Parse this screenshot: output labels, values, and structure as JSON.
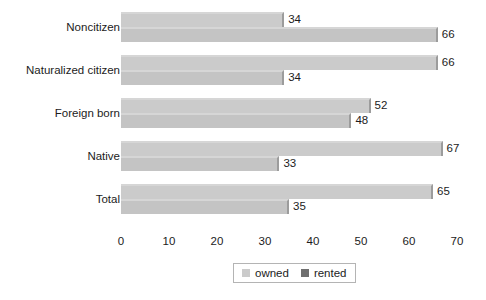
{
  "chart_data": {
    "type": "bar",
    "orientation": "horizontal",
    "title": "",
    "subtitle": "",
    "xlabel": "",
    "ylabel": "",
    "xlim": [
      0,
      70
    ],
    "xticks": [
      0,
      10,
      20,
      30,
      40,
      50,
      60,
      70
    ],
    "xtick_labels": [
      "0",
      "10",
      "20",
      "30",
      "40",
      "50",
      "60",
      "70"
    ],
    "grid": false,
    "legend_position": "bottom",
    "categories": [
      "Noncitizen",
      "Naturalized citizen",
      "Foreign born",
      "Native",
      "Total"
    ],
    "series": [
      {
        "name": "owned",
        "color": "#cbcbcb",
        "values": [
          34,
          66,
          52,
          67,
          65
        ]
      },
      {
        "name": "rented",
        "color": "#c4c4c4",
        "values": [
          66,
          34,
          48,
          33,
          35
        ]
      }
    ],
    "bars": [
      {
        "category": "Noncitizen",
        "top": {
          "series": "owned",
          "value": 34,
          "label": "34"
        },
        "bottom": {
          "series": "rented",
          "value": 66,
          "label": "66"
        }
      },
      {
        "category": "Naturalized citizen",
        "top": {
          "series": "owned",
          "value": 66,
          "label": "66"
        },
        "bottom": {
          "series": "rented",
          "value": 34,
          "label": "34"
        }
      },
      {
        "category": "Foreign born",
        "top": {
          "series": "owned",
          "value": 52,
          "label": "52"
        },
        "bottom": {
          "series": "rented",
          "value": 48,
          "label": "48"
        }
      },
      {
        "category": "Native",
        "top": {
          "series": "owned",
          "value": 67,
          "label": "67"
        },
        "bottom": {
          "series": "rented",
          "value": 33,
          "label": "33"
        }
      },
      {
        "category": "Total",
        "top": {
          "series": "owned",
          "value": 65,
          "label": "65"
        },
        "bottom": {
          "series": "rented",
          "value": 35,
          "label": "35"
        }
      }
    ],
    "legend": [
      {
        "label": "owned",
        "color": "#cbcbcb"
      },
      {
        "label": "rented",
        "color": "#6f6f6f"
      }
    ]
  },
  "colors": {
    "background": "#ffffff",
    "bar_owned": "#cbcbcb",
    "bar_rented": "#c4c4c4",
    "bar_highlight": "#d6d6d6",
    "bar_shadow": "#9c9c9c",
    "text": "#1c1c1c",
    "legend_border": "#b4b4b4",
    "legend_swatch_owned": "#cbcbcb",
    "legend_swatch_rented": "#6f6f6f"
  }
}
